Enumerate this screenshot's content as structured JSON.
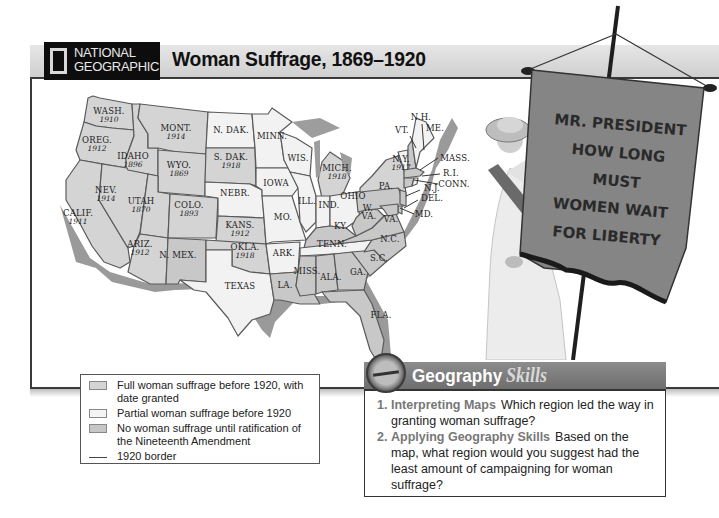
{
  "header": {
    "logo_line1": "NATIONAL",
    "logo_line2": "GEOGRAPHIC",
    "title": "Woman Suffrage, 1869–1920"
  },
  "map": {
    "states": [
      {
        "name": "WASH.",
        "year": "1910",
        "status": "full"
      },
      {
        "name": "OREG.",
        "year": "1912",
        "status": "full"
      },
      {
        "name": "CALIF.",
        "year": "1911",
        "status": "full"
      },
      {
        "name": "IDAHO",
        "year": "1896",
        "status": "full"
      },
      {
        "name": "NEV.",
        "year": "1914",
        "status": "full"
      },
      {
        "name": "MONT.",
        "year": "1914",
        "status": "full"
      },
      {
        "name": "WYO.",
        "year": "1869",
        "status": "full"
      },
      {
        "name": "UTAH",
        "year": "1870",
        "status": "full"
      },
      {
        "name": "COLO.",
        "year": "1893",
        "status": "full"
      },
      {
        "name": "ARIZ.",
        "year": "1912",
        "status": "full"
      },
      {
        "name": "N. MEX.",
        "year": "",
        "status": "none"
      },
      {
        "name": "N. DAK.",
        "year": "",
        "status": "partial"
      },
      {
        "name": "S. DAK.",
        "year": "1918",
        "status": "full"
      },
      {
        "name": "NEBR.",
        "year": "",
        "status": "partial"
      },
      {
        "name": "KANS.",
        "year": "1912",
        "status": "full"
      },
      {
        "name": "OKLA.",
        "year": "1918",
        "status": "full"
      },
      {
        "name": "TEXAS",
        "year": "",
        "status": "partial"
      },
      {
        "name": "MINN.",
        "year": "",
        "status": "partial"
      },
      {
        "name": "IOWA",
        "year": "",
        "status": "partial"
      },
      {
        "name": "MO.",
        "year": "",
        "status": "partial"
      },
      {
        "name": "ARK.",
        "year": "",
        "status": "partial"
      },
      {
        "name": "LA.",
        "year": "",
        "status": "none"
      },
      {
        "name": "WIS.",
        "year": "",
        "status": "partial"
      },
      {
        "name": "ILL.",
        "year": "",
        "status": "partial"
      },
      {
        "name": "MICH.",
        "year": "1918",
        "status": "full"
      },
      {
        "name": "IND.",
        "year": "",
        "status": "partial"
      },
      {
        "name": "OHIO",
        "year": "",
        "status": "partial"
      },
      {
        "name": "KY.",
        "year": "",
        "status": "none"
      },
      {
        "name": "TENN.",
        "year": "",
        "status": "partial"
      },
      {
        "name": "MISS.",
        "year": "",
        "status": "none"
      },
      {
        "name": "ALA.",
        "year": "",
        "status": "none"
      },
      {
        "name": "GA.",
        "year": "",
        "status": "none"
      },
      {
        "name": "FLA.",
        "year": "",
        "status": "none"
      },
      {
        "name": "S.C.",
        "year": "",
        "status": "none"
      },
      {
        "name": "N.C.",
        "year": "",
        "status": "none"
      },
      {
        "name": "VA.",
        "year": "",
        "status": "none"
      },
      {
        "name": "W. VA.",
        "year": "",
        "status": "none"
      },
      {
        "name": "PA.",
        "year": "",
        "status": "none"
      },
      {
        "name": "N.Y.",
        "year": "1917",
        "status": "full"
      },
      {
        "name": "VT.",
        "year": "",
        "status": "partial"
      },
      {
        "name": "N.H.",
        "year": "",
        "status": "none"
      },
      {
        "name": "ME.",
        "year": "",
        "status": "partial"
      },
      {
        "name": "MASS.",
        "year": "",
        "status": "none"
      },
      {
        "name": "R.I.",
        "year": "",
        "status": "partial"
      },
      {
        "name": "CONN.",
        "year": "",
        "status": "none"
      },
      {
        "name": "N.J.",
        "year": "",
        "status": "none"
      },
      {
        "name": "DEL.",
        "year": "",
        "status": "none"
      },
      {
        "name": "MD.",
        "year": "",
        "status": "none"
      }
    ],
    "labels": {
      "wash": "WASH.",
      "wash_y": "1910",
      "oreg": "OREG.",
      "oreg_y": "1912",
      "calif": "CALIF.",
      "calif_y": "1911",
      "idaho": "IDAHO",
      "idaho_y": "1896",
      "nev": "NEV.",
      "nev_y": "1914",
      "mont": "MONT.",
      "mont_y": "1914",
      "wyo": "WYO.",
      "wyo_y": "1869",
      "utah": "UTAH",
      "utah_y": "1870",
      "colo": "COLO.",
      "colo_y": "1893",
      "ariz": "ARIZ.",
      "ariz_y": "1912",
      "nmex": "N. MEX.",
      "ndak": "N. DAK.",
      "sdak": "S. DAK.",
      "sdak_y": "1918",
      "nebr": "NEBR.",
      "kans": "KANS.",
      "kans_y": "1912",
      "okla": "OKLA.",
      "okla_y": "1918",
      "texas": "TEXAS",
      "minn": "MINN.",
      "iowa": "IOWA",
      "mo": "MO.",
      "ark": "ARK.",
      "la": "LA.",
      "wis": "WIS.",
      "ill": "ILL.",
      "mich": "MICH.",
      "mich_y": "1918",
      "ind": "IND.",
      "ohio": "OHIO",
      "ky": "KY.",
      "tenn": "TENN.",
      "miss": "MISS.",
      "ala": "ALA.",
      "ga": "GA.",
      "fla": "FLA.",
      "sc": "S.C.",
      "nc": "N.C.",
      "va": "VA.",
      "wva1": "W.",
      "wva2": "VA.",
      "pa": "PA.",
      "ny": "N.Y.",
      "ny_y": "1917",
      "vt": "VT.",
      "nh": "N.H.",
      "me": "ME.",
      "mass": "MASS.",
      "ri": "R.I.",
      "conn": "CONN.",
      "nj": "N.J.",
      "del": "DEL.",
      "md": "MD."
    }
  },
  "photo": {
    "banner_lines": [
      "MR. PRESIDENT",
      "HOW LONG",
      "MUST",
      "WOMEN WAIT",
      "FOR LIBERTY"
    ]
  },
  "legend": {
    "items": [
      {
        "swatch": "full",
        "label": "Full woman suffrage before 1920, with date granted"
      },
      {
        "swatch": "partial",
        "label": "Partial woman suffrage before 1920"
      },
      {
        "swatch": "none",
        "label": "No woman suffrage until ratification of the Nineteenth Amendment"
      },
      {
        "swatch": "line",
        "label": "1920 border"
      }
    ]
  },
  "skills": {
    "title_main": "Geography",
    "title_accent": "Skills",
    "questions": [
      {
        "num": "1.",
        "head": "Interpreting Maps",
        "text": "Which region led the way in granting woman suffrage?"
      },
      {
        "num": "2.",
        "head": "Applying Geography Skills",
        "text": "Based on the map, what region would you suggest had the least amount of campaigning for woman suffrage?"
      }
    ]
  },
  "colors": {
    "full": "#d4d4d4",
    "partial": "#f2f2f2",
    "none": "#c8c8c8",
    "title_bar": "#d9d9d9",
    "logo_bg": "#0d0d0d",
    "skills_bar": "#7d7d7d"
  }
}
